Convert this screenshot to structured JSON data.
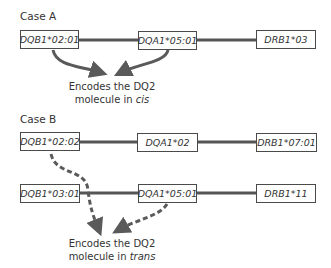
{
  "diagram": {
    "case_a": {
      "label": "Case A",
      "haplotype": [
        {
          "allele": "DQB1*02:01"
        },
        {
          "allele": "DQA1*05:01"
        },
        {
          "allele": "DRB1*03"
        }
      ],
      "note_line1": "Encodes the DQ2",
      "note_line2_prefix": "molecule in ",
      "note_line2_em": "cis",
      "arrow_style": "solid"
    },
    "case_b": {
      "label": "Case B",
      "haplotype_1": [
        {
          "allele": "DQB1*02:02"
        },
        {
          "allele": "DQA1*02"
        },
        {
          "allele": "DRB1*07:01"
        }
      ],
      "haplotype_2": [
        {
          "allele": "DQB1*03:01"
        },
        {
          "allele": "DQA1*05:01"
        },
        {
          "allele": "DRB1*11"
        }
      ],
      "note_line1": "Encodes the DQ2",
      "note_line2_prefix": "molecule in ",
      "note_line2_em": "trans",
      "arrow_style": "dashed"
    },
    "colors": {
      "line": "#555555",
      "arrow": "#5a5a5a",
      "box_border": "#4a4a4a",
      "text": "#333333"
    }
  }
}
